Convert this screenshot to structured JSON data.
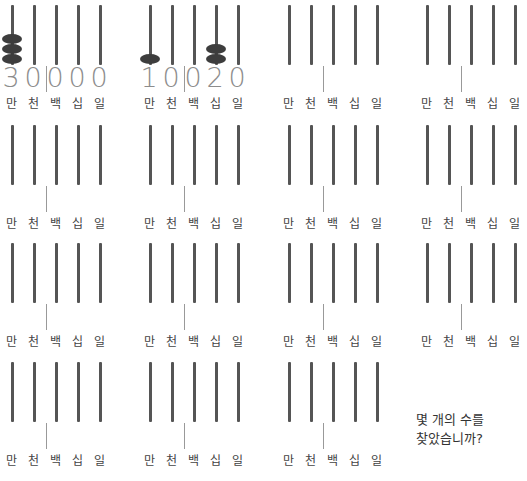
{
  "place_labels": [
    "만",
    "천",
    "백",
    "십",
    "일"
  ],
  "abacuses": [
    {
      "digits": [
        "3",
        "0",
        "0",
        "0",
        "0"
      ],
      "beads": [
        3,
        0,
        0,
        0,
        0
      ]
    },
    {
      "digits": [
        "1",
        "0",
        "0",
        "2",
        "0"
      ],
      "beads": [
        1,
        0,
        0,
        2,
        0
      ]
    },
    {
      "digits": [
        "",
        "",
        "",
        "",
        ""
      ],
      "beads": [
        0,
        0,
        0,
        0,
        0
      ]
    },
    {
      "digits": [
        "",
        "",
        "",
        "",
        ""
      ],
      "beads": [
        0,
        0,
        0,
        0,
        0
      ]
    },
    {
      "digits": [
        "",
        "",
        "",
        "",
        ""
      ],
      "beads": [
        0,
        0,
        0,
        0,
        0
      ]
    },
    {
      "digits": [
        "",
        "",
        "",
        "",
        ""
      ],
      "beads": [
        0,
        0,
        0,
        0,
        0
      ]
    },
    {
      "digits": [
        "",
        "",
        "",
        "",
        ""
      ],
      "beads": [
        0,
        0,
        0,
        0,
        0
      ]
    },
    {
      "digits": [
        "",
        "",
        "",
        "",
        ""
      ],
      "beads": [
        0,
        0,
        0,
        0,
        0
      ]
    },
    {
      "digits": [
        "",
        "",
        "",
        "",
        ""
      ],
      "beads": [
        0,
        0,
        0,
        0,
        0
      ]
    },
    {
      "digits": [
        "",
        "",
        "",
        "",
        ""
      ],
      "beads": [
        0,
        0,
        0,
        0,
        0
      ]
    },
    {
      "digits": [
        "",
        "",
        "",
        "",
        ""
      ],
      "beads": [
        0,
        0,
        0,
        0,
        0
      ]
    },
    {
      "digits": [
        "",
        "",
        "",
        "",
        ""
      ],
      "beads": [
        0,
        0,
        0,
        0,
        0
      ]
    },
    {
      "digits": [
        "",
        "",
        "",
        "",
        ""
      ],
      "beads": [
        0,
        0,
        0,
        0,
        0
      ]
    },
    {
      "digits": [
        "",
        "",
        "",
        "",
        ""
      ],
      "beads": [
        0,
        0,
        0,
        0,
        0
      ]
    },
    {
      "digits": [
        "",
        "",
        "",
        "",
        ""
      ],
      "beads": [
        0,
        0,
        0,
        0,
        0
      ]
    }
  ],
  "prompt": {
    "line1": "몇 개의 수를",
    "line2": "찾았습니까?"
  },
  "colors": {
    "rod": "#555555",
    "bead": "#3d3d3d",
    "digit": "#8c8c8c"
  }
}
